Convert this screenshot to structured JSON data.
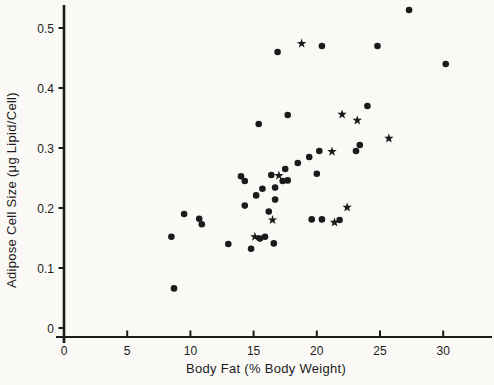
{
  "figure": {
    "background": "#faf9f6",
    "ink": "#1b1b1b"
  },
  "chart_data": {
    "type": "scatter",
    "title": "",
    "xlabel": "Body Fat (% Body Weight)",
    "ylabel": "Adipose Cell Size (μg Lipid/Cell)",
    "xlim": [
      0,
      34
    ],
    "ylim": [
      0,
      0.54
    ],
    "grid": false,
    "legend": "none",
    "x_ticks": [
      "0",
      "5",
      "10",
      "15",
      "20",
      "25",
      "30"
    ],
    "x_tick_values": [
      0,
      5,
      10,
      15,
      20,
      25,
      30
    ],
    "y_ticks": [
      "0",
      "0.1",
      "0.2",
      "0.3",
      "0.4",
      "0.5"
    ],
    "y_tick_values": [
      0,
      0.1,
      0.2,
      0.3,
      0.4,
      0.5
    ],
    "series": [
      {
        "name": "circle-marker-subjects",
        "marker": "filled-circle",
        "color": "#1b1b1b",
        "points": [
          [
            8.5,
            0.152
          ],
          [
            8.7,
            0.066
          ],
          [
            9.5,
            0.19
          ],
          [
            10.7,
            0.182
          ],
          [
            10.9,
            0.173
          ],
          [
            13.0,
            0.14
          ],
          [
            14.0,
            0.253
          ],
          [
            14.3,
            0.245
          ],
          [
            14.3,
            0.204
          ],
          [
            14.8,
            0.132
          ],
          [
            15.2,
            0.221
          ],
          [
            15.4,
            0.34
          ],
          [
            15.5,
            0.149
          ],
          [
            15.9,
            0.152
          ],
          [
            15.7,
            0.232
          ],
          [
            16.2,
            0.194
          ],
          [
            16.4,
            0.255
          ],
          [
            16.6,
            0.141
          ],
          [
            16.7,
            0.234
          ],
          [
            16.7,
            0.214
          ],
          [
            16.9,
            0.46
          ],
          [
            17.3,
            0.245
          ],
          [
            17.5,
            0.265
          ],
          [
            17.7,
            0.355
          ],
          [
            17.7,
            0.246
          ],
          [
            18.5,
            0.275
          ],
          [
            19.4,
            0.285
          ],
          [
            19.6,
            0.181
          ],
          [
            20.0,
            0.257
          ],
          [
            20.2,
            0.295
          ],
          [
            20.4,
            0.47
          ],
          [
            20.4,
            0.181
          ],
          [
            21.8,
            0.18
          ],
          [
            23.1,
            0.295
          ],
          [
            23.4,
            0.305
          ],
          [
            24.0,
            0.37
          ],
          [
            24.8,
            0.47
          ],
          [
            27.3,
            0.53
          ],
          [
            30.2,
            0.44
          ]
        ]
      },
      {
        "name": "star-marker-subjects",
        "marker": "filled-star",
        "color": "#1b1b1b",
        "points": [
          [
            15.1,
            0.152
          ],
          [
            16.5,
            0.18
          ],
          [
            17.0,
            0.254
          ],
          [
            18.8,
            0.474
          ],
          [
            21.2,
            0.294
          ],
          [
            21.4,
            0.176
          ],
          [
            22.0,
            0.356
          ],
          [
            22.4,
            0.201
          ],
          [
            23.2,
            0.346
          ],
          [
            25.7,
            0.316
          ]
        ]
      }
    ]
  }
}
